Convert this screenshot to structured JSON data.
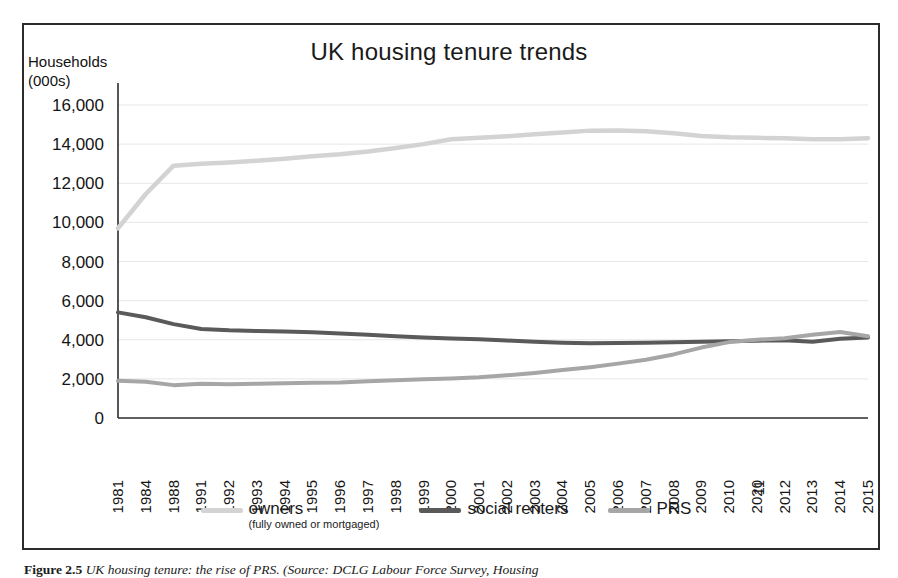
{
  "chart_data": {
    "type": "line",
    "title": "UK housing tenure trends",
    "ylabel": "Households\n(000s)",
    "xlabel": "",
    "ylim": [
      0,
      16000
    ],
    "ytick_step": 2000,
    "yticks": [
      "0",
      "2,000",
      "4,000",
      "6,000",
      "8,000",
      "10,000",
      "12,000",
      "14,000",
      "16,000"
    ],
    "grid": true,
    "legend_position": "bottom",
    "categories": [
      "1981",
      "1984",
      "1988",
      "1991",
      "1992",
      "1993",
      "1994",
      "1995",
      "1996",
      "1997",
      "1998",
      "1999",
      "2000",
      "2001",
      "2002",
      "2003",
      "2004",
      "2005",
      "2006",
      "2007",
      "2008",
      "2009",
      "2010",
      "2011",
      "2012",
      "2013",
      "2014",
      "2015"
    ],
    "xtick_overlap_note": "2020/2011 labels overlap in the scan at the 2011 position",
    "xtick_labels": [
      "1981",
      "1984",
      "1988",
      "1991",
      "1992",
      "1993",
      "1994",
      "1995",
      "1996",
      "1997",
      "1998",
      "1999",
      "2000",
      "2001",
      "2002",
      "2003",
      "2004",
      "2005",
      "2006",
      "2007",
      "2008",
      "2009",
      "2010",
      "2020 11",
      "2012",
      "2013",
      "2014",
      "2015"
    ],
    "series": [
      {
        "name": "owners",
        "sublabel": "(fully owned or mortgaged)",
        "color": "#d3d3d3",
        "values": [
          9700,
          11450,
          12900,
          13000,
          13060,
          13150,
          13250,
          13380,
          13480,
          13620,
          13800,
          14000,
          14250,
          14320,
          14400,
          14500,
          14600,
          14690,
          14700,
          14660,
          14560,
          14420,
          14350,
          14320,
          14300,
          14250,
          14250,
          14300
        ]
      },
      {
        "name": "social renters",
        "color": "#5a5a5a",
        "values": [
          5400,
          5150,
          4800,
          4550,
          4480,
          4450,
          4420,
          4380,
          4320,
          4250,
          4180,
          4120,
          4070,
          4020,
          3960,
          3900,
          3850,
          3820,
          3840,
          3850,
          3870,
          3900,
          3920,
          3950,
          3980,
          3900,
          4050,
          4120
        ]
      },
      {
        "name": "PRS",
        "color": "#a6a6a6",
        "values": [
          1900,
          1850,
          1680,
          1750,
          1720,
          1750,
          1770,
          1800,
          1820,
          1880,
          1930,
          1980,
          2020,
          2080,
          2180,
          2300,
          2450,
          2600,
          2780,
          2980,
          3250,
          3600,
          3880,
          4000,
          4080,
          4250,
          4400,
          4180
        ]
      }
    ]
  },
  "legend": {
    "items": [
      {
        "label": "owners",
        "sub": "(fully owned or\nmortgaged)",
        "color": "#d3d3d3"
      },
      {
        "label": "social renters",
        "sub": "",
        "color": "#5a5a5a"
      },
      {
        "label": "PRS",
        "sub": "",
        "color": "#a6a6a6"
      }
    ]
  },
  "caption": {
    "figure_number": "Figure 2.5",
    "text": "UK housing tenure: the rise of PRS. (Source: DCLG Labour Force Survey, Housing"
  }
}
